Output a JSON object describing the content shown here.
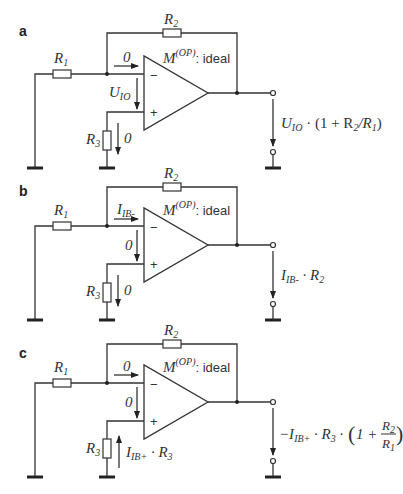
{
  "figure": {
    "panels": [
      {
        "label": "a",
        "r1": "R",
        "r1_sub": "1",
        "r2": "R",
        "r2_sub": "2",
        "r3": "R",
        "r3_sub": "3",
        "opamp_model": "M",
        "opamp_model_sup": "(OP)",
        "opamp_desc": ": ideal",
        "minus_sign": "−",
        "plus_sign": "+",
        "input_current_label": "0",
        "input_voltage_label": "U",
        "input_voltage_sub": "IO",
        "r3_voltage_label": "0",
        "output_expr": {
          "parts": [
            "U",
            "IO",
            " · (1 + R",
            "2",
            "/R",
            "1",
            ")"
          ]
        }
      },
      {
        "label": "b",
        "r1": "R",
        "r1_sub": "1",
        "r2": "R",
        "r2_sub": "2",
        "r3": "R",
        "r3_sub": "3",
        "opamp_model": "M",
        "opamp_model_sup": "(OP)",
        "opamp_desc": ": ideal",
        "minus_sign": "−",
        "plus_sign": "+",
        "input_current_label": "I",
        "input_current_sub": "IB-",
        "input_voltage_label": "0",
        "r3_voltage_label": "0",
        "output_expr": {
          "parts": [
            "I",
            "IB-",
            " · R",
            "2"
          ]
        }
      },
      {
        "label": "c",
        "r1": "R",
        "r1_sub": "1",
        "r2": "R",
        "r2_sub": "2",
        "r3": "R",
        "r3_sub": "3",
        "opamp_model": "M",
        "opamp_model_sup": "(OP)",
        "opamp_desc": ": ideal",
        "minus_sign": "−",
        "plus_sign": "+",
        "input_current_label": "0",
        "input_voltage_label": "0",
        "r3_voltage_label": "I",
        "r3_voltage_sub": "IB+",
        "r3_voltage_tail": " · R",
        "r3_voltage_tail_sub": "3",
        "output_expr": {
          "parts": [
            "−I",
            "IB+",
            " · R",
            "3",
            " · ",
            "(",
            "1 + ",
            "R",
            "2",
            "R",
            "1",
            ")"
          ]
        }
      }
    ]
  }
}
